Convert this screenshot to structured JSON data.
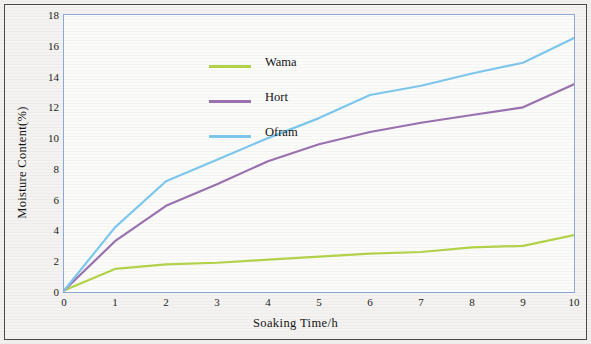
{
  "chart_data": {
    "type": "line",
    "title": "",
    "xlabel": "Soaking Time/h",
    "ylabel": "Moisture Content(%)",
    "xlim": [
      0,
      10
    ],
    "ylim": [
      0,
      18
    ],
    "xticks": [
      "0",
      "1",
      "2",
      "3",
      "4",
      "5",
      "6",
      "7",
      "8",
      "9",
      "10"
    ],
    "yticks": [
      "0",
      "2",
      "4",
      "6",
      "8",
      "10",
      "12",
      "14",
      "16",
      "18"
    ],
    "grid": false,
    "legend_position": "upper-left-inside",
    "x": [
      0,
      1,
      2,
      3,
      4,
      5,
      6,
      7,
      8,
      9,
      10
    ],
    "series": [
      {
        "name": "Wama",
        "color": "#b5d34a",
        "values": [
          0.1,
          1.5,
          1.8,
          1.9,
          2.1,
          2.3,
          2.5,
          2.6,
          2.9,
          3.0,
          3.7
        ]
      },
      {
        "name": "Hort",
        "color": "#9b72b0",
        "values": [
          0.1,
          3.3,
          5.6,
          7.0,
          8.5,
          9.6,
          10.4,
          11.0,
          11.5,
          12.0,
          13.5
        ]
      },
      {
        "name": "Ofram",
        "color": "#7ec8ee",
        "values": [
          0.1,
          4.2,
          7.2,
          8.6,
          10.0,
          11.3,
          12.8,
          13.4,
          14.2,
          14.9,
          16.5
        ]
      }
    ]
  },
  "legend": {
    "items": [
      {
        "label": "Wama",
        "color": "#b5d34a"
      },
      {
        "label": "Hort",
        "color": "#9b72b0"
      },
      {
        "label": "Ofram",
        "color": "#7ec8ee"
      }
    ]
  }
}
